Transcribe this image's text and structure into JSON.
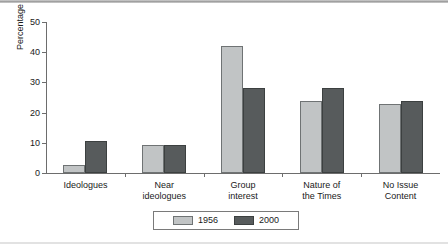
{
  "chart_data": {
    "type": "bar",
    "title": "",
    "xlabel": "",
    "ylabel": "Percentage",
    "ylim": [
      0,
      50
    ],
    "yticks": [
      0,
      10,
      20,
      30,
      40,
      50
    ],
    "grid": false,
    "legend_position": "bottom",
    "categories": [
      [
        "Ideologues"
      ],
      [
        "Near",
        "ideologues"
      ],
      [
        "Group",
        "interest"
      ],
      [
        "Nature of",
        "the Times"
      ],
      [
        "No Issue",
        "Content"
      ]
    ],
    "series": [
      {
        "name": "1956",
        "color": "#c1c4c5",
        "values": [
          2.5,
          9.3,
          42.0,
          24.0,
          23.0
        ]
      },
      {
        "name": "2000",
        "color": "#575b5c",
        "values": [
          10.5,
          9.3,
          28.0,
          28.0,
          24.0
        ]
      }
    ]
  }
}
